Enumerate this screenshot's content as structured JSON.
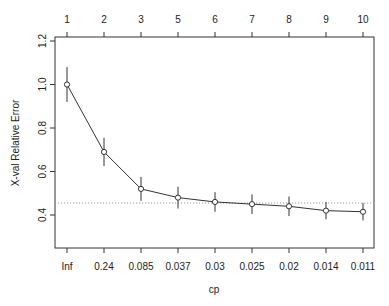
{
  "chart_data": {
    "type": "line",
    "title": "",
    "xlabel": "cp",
    "ylabel": "X-val Relative Error",
    "top_axis_label": "size of tree",
    "categories": [
      "Inf",
      "0.24",
      "0.085",
      "0.037",
      "0.03",
      "0.025",
      "0.02",
      "0.014",
      "0.011"
    ],
    "top_ticks": [
      "1",
      "2",
      "3",
      "5",
      "6",
      "7",
      "8",
      "9",
      "10"
    ],
    "series": [
      {
        "name": "xerror",
        "values": [
          1.0,
          0.69,
          0.52,
          0.48,
          0.46,
          0.45,
          0.44,
          0.42,
          0.415
        ],
        "errors": [
          0.08,
          0.065,
          0.055,
          0.05,
          0.045,
          0.045,
          0.045,
          0.04,
          0.04
        ]
      }
    ],
    "reference_line": {
      "value": 0.455,
      "style": "dotted"
    },
    "yticks": [
      "0.4",
      "0.6",
      "0.8",
      "1.0",
      "1.2"
    ],
    "ylim": [
      0.3,
      1.22
    ],
    "grid": false,
    "legend": null
  },
  "colors": {
    "line": "#333333",
    "reference": "#999999",
    "axis": "#333333"
  }
}
